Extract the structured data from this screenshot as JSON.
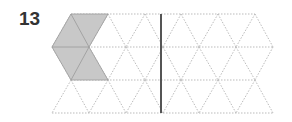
{
  "problem": {
    "number": "13"
  },
  "grid": {
    "type": "isometric-triangle-grid",
    "row_y": [
      14,
      47,
      80,
      113
    ],
    "even_row_x": [
      71,
      108,
      145,
      181,
      218,
      255
    ],
    "odd_row_x": [
      52,
      89,
      126,
      163,
      199,
      236,
      273
    ],
    "line_color": "#bbbbbb"
  },
  "shaded_shape": {
    "points": "71,14 108,14 89,47 108,80 71,80 52,47",
    "fill": "#c8c8c8",
    "stroke": "#999999"
  },
  "mirror_line": {
    "x": 161,
    "y1": 14,
    "y2": 113,
    "color": "#555555"
  }
}
